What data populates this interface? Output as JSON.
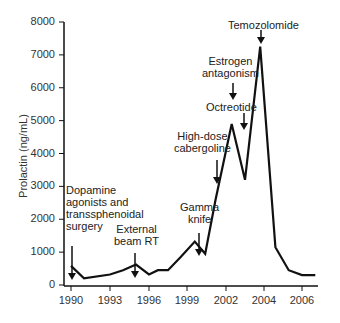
{
  "chart_data": {
    "type": "line",
    "title": "",
    "xlabel": "",
    "ylabel": "Prolactin (ng/mL)",
    "ylim": [
      0,
      8000
    ],
    "xlim": [
      1990,
      2007
    ],
    "grid": false,
    "legend": null,
    "y_ticks": [
      "0",
      "1000",
      "2000",
      "3000",
      "4000",
      "5000",
      "6000",
      "7000",
      "8000"
    ],
    "x_ticks": [
      "1990",
      "1993",
      "1996",
      "1999",
      "2002",
      "2004",
      "2006"
    ],
    "x": [
      1990,
      1991,
      1993,
      1994,
      1995,
      1996,
      1996.7,
      1997.5,
      1998.5,
      1999.6,
      2000.4,
      2001.2,
      2002.3,
      2003.0,
      2003.8,
      2004.6,
      2005.3,
      2006.0,
      2006.7
    ],
    "values": [
      580,
      200,
      320,
      450,
      620,
      320,
      450,
      450,
      850,
      1320,
      950,
      2600,
      4900,
      3200,
      7250,
      1150,
      450,
      300,
      300
    ],
    "annotations": [
      {
        "text": "Dopamine\nagonists and\ntransphenoidal\nsurgery",
        "x": 1990,
        "y": 580
      },
      {
        "text": "External\nbeam RT",
        "x": 1995,
        "y": 620
      },
      {
        "text": "Gamma\nknife",
        "x": 1999.6,
        "y": 1320
      },
      {
        "text": "High-dose\ncabergoline",
        "x": 2001.5,
        "y": 3300
      },
      {
        "text": "Octreotide",
        "x": 2002.6,
        "y": 4800
      },
      {
        "text": "Estrogen\nantagonism",
        "x": 2002.1,
        "y": 6300
      },
      {
        "text": "Temozolomide",
        "x": 2003.8,
        "y": 7250
      }
    ]
  },
  "labels": {
    "ylabel": "Prolactin (ng/mL)",
    "ann_dopamine": "Dopamine\nagonists and\ntranssphenoidal\nsurgery",
    "ann_external": "External\nbeam RT",
    "ann_gamma": "Gamma\nknife",
    "ann_cabergoline": "High-dose\ncabergoline",
    "ann_octreotide": "Octreotide",
    "ann_estrogen": "Estrogen\nantagonism",
    "ann_temozolomide": "Temozolomide"
  }
}
